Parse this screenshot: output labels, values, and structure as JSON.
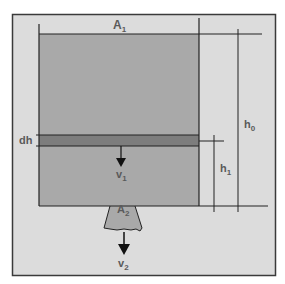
{
  "diagram": {
    "type": "tank-draining-schematic",
    "colors": {
      "background": "#ffffff",
      "frame_fill": "#dcdcdc",
      "frame_border": "#3a3a3a",
      "liquid": "#a9a9a9",
      "slice_dh": "#7d7d7d",
      "nozzle": "#a9a9a9",
      "lines": "#222222",
      "label": "#5a5a5a"
    },
    "labels": {
      "a1": {
        "main": "A",
        "sub": "1"
      },
      "a2": {
        "main": "A",
        "sub": "2"
      },
      "h0": {
        "main": "h",
        "sub": "0"
      },
      "h1": {
        "main": "h",
        "sub": "1"
      },
      "dh": {
        "main": "dh"
      },
      "v1": {
        "main": "v",
        "sub": "1"
      },
      "v2": {
        "main": "v",
        "sub": "2"
      }
    },
    "elements": [
      "outer-frame",
      "tank-liquid",
      "liquid-surface-line",
      "slice-dh",
      "outlet-nozzle",
      "dimension-h0",
      "dimension-h1",
      "arrow-v1",
      "arrow-v2"
    ]
  }
}
